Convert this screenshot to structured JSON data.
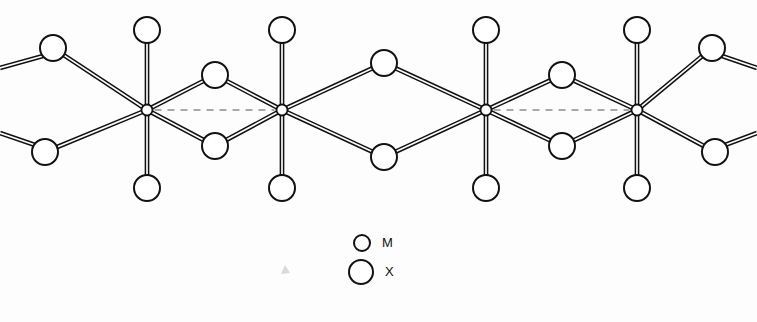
{
  "figure": {
    "kind": "crystal-structure-schematic",
    "background_color": "#fdfdfd",
    "line_color": "#111111",
    "dashed_color": "#8d8d8d",
    "atom_fill": "#ffffff"
  },
  "geometry": {
    "metal_radius": 5.5,
    "ligand_radius": 13,
    "bond_offset": 1.6,
    "metal_y": 110,
    "axial_top_y": 30,
    "axial_bottom_y": 188,
    "bridge_top_y": 75,
    "bridge_bottom_y": 146,
    "equatorial_top_y": 48,
    "equatorial_bottom_y": 152
  },
  "metals": [
    {
      "id": "M1",
      "label": "M",
      "x": 147,
      "y": 110
    },
    {
      "id": "M2",
      "label": "M",
      "x": 282,
      "y": 110
    },
    {
      "id": "M3",
      "label": "M",
      "x": 486,
      "y": 110
    },
    {
      "id": "M4",
      "label": "M",
      "x": 637,
      "y": 110
    }
  ],
  "metal_contacts": [
    {
      "from": "M1",
      "to": "M2",
      "x1": 147,
      "x2": 282,
      "y": 110,
      "style": "dashed",
      "kind": "short"
    },
    {
      "from": "M2",
      "to": "M3",
      "x1": 282,
      "x2": 486,
      "y": 110,
      "style": "none",
      "kind": "long"
    },
    {
      "from": "M3",
      "to": "M4",
      "x1": 486,
      "x2": 637,
      "y": 110,
      "style": "dashed",
      "kind": "short"
    }
  ],
  "ligands": [
    {
      "id": "X-axial-top-1",
      "label": "X",
      "x": 147,
      "y": 30,
      "role": "axial"
    },
    {
      "id": "X-axial-bot-1",
      "label": "X",
      "x": 147,
      "y": 188,
      "role": "axial"
    },
    {
      "id": "X-axial-top-2",
      "label": "X",
      "x": 282,
      "y": 30,
      "role": "axial"
    },
    {
      "id": "X-axial-bot-2",
      "label": "X",
      "x": 282,
      "y": 188,
      "role": "axial"
    },
    {
      "id": "X-axial-top-3",
      "label": "X",
      "x": 486,
      "y": 30,
      "role": "axial"
    },
    {
      "id": "X-axial-bot-3",
      "label": "X",
      "x": 486,
      "y": 188,
      "role": "axial"
    },
    {
      "id": "X-axial-top-4",
      "label": "X",
      "x": 637,
      "y": 30,
      "role": "axial"
    },
    {
      "id": "X-axial-bot-4",
      "label": "X",
      "x": 637,
      "y": 188,
      "role": "axial"
    },
    {
      "id": "X-bridge-top-12",
      "label": "X",
      "x": 215,
      "y": 75,
      "role": "bridging"
    },
    {
      "id": "X-bridge-bot-12",
      "label": "X",
      "x": 215,
      "y": 146,
      "role": "bridging"
    },
    {
      "id": "X-bridge-top-23",
      "label": "X",
      "x": 384,
      "y": 63,
      "role": "bridging"
    },
    {
      "id": "X-bridge-bot-23",
      "label": "X",
      "x": 384,
      "y": 157,
      "role": "bridging"
    },
    {
      "id": "X-bridge-top-34",
      "label": "X",
      "x": 562,
      "y": 75,
      "role": "bridging"
    },
    {
      "id": "X-bridge-bot-34",
      "label": "X",
      "x": 562,
      "y": 146,
      "role": "bridging"
    },
    {
      "id": "X-term-top-left",
      "label": "X",
      "x": 53,
      "y": 48,
      "role": "terminal"
    },
    {
      "id": "X-term-bot-left",
      "label": "X",
      "x": 45,
      "y": 152,
      "role": "terminal"
    },
    {
      "id": "X-term-top-right",
      "label": "X",
      "x": 712,
      "y": 48,
      "role": "terminal"
    },
    {
      "id": "X-term-bot-right",
      "label": "X",
      "x": 715,
      "y": 152,
      "role": "terminal"
    }
  ],
  "bonds": [
    {
      "from": "M1",
      "to": "X-axial-top-1"
    },
    {
      "from": "M1",
      "to": "X-axial-bot-1"
    },
    {
      "from": "M1",
      "to": "X-bridge-top-12"
    },
    {
      "from": "M1",
      "to": "X-bridge-bot-12"
    },
    {
      "from": "M1",
      "to": "X-term-top-left"
    },
    {
      "from": "M1",
      "to": "X-term-bot-left"
    },
    {
      "from": "M2",
      "to": "X-axial-top-2"
    },
    {
      "from": "M2",
      "to": "X-axial-bot-2"
    },
    {
      "from": "M2",
      "to": "X-bridge-top-12"
    },
    {
      "from": "M2",
      "to": "X-bridge-bot-12"
    },
    {
      "from": "M2",
      "to": "X-bridge-top-23"
    },
    {
      "from": "M2",
      "to": "X-bridge-bot-23"
    },
    {
      "from": "M3",
      "to": "X-axial-top-3"
    },
    {
      "from": "M3",
      "to": "X-axial-bot-3"
    },
    {
      "from": "M3",
      "to": "X-bridge-top-23"
    },
    {
      "from": "M3",
      "to": "X-bridge-bot-23"
    },
    {
      "from": "M3",
      "to": "X-bridge-top-34"
    },
    {
      "from": "M3",
      "to": "X-bridge-bot-34"
    },
    {
      "from": "M4",
      "to": "X-axial-top-4"
    },
    {
      "from": "M4",
      "to": "X-axial-bot-4"
    },
    {
      "from": "M4",
      "to": "X-bridge-top-34"
    },
    {
      "from": "M4",
      "to": "X-bridge-bot-34"
    },
    {
      "from": "M4",
      "to": "X-term-top-right"
    },
    {
      "from": "M4",
      "to": "X-term-bot-right"
    }
  ],
  "chain_stubs": [
    {
      "id": "stub-top-left",
      "from": "X-term-top-left",
      "x1": 43,
      "y1": 56,
      "x2": 0,
      "y2": 68
    },
    {
      "id": "stub-bot-left",
      "from": "X-term-bot-left",
      "x1": 35,
      "y1": 145,
      "x2": 0,
      "y2": 133
    },
    {
      "id": "stub-top-right",
      "from": "X-term-top-right",
      "x1": 722,
      "y1": 56,
      "x2": 757,
      "y2": 68
    },
    {
      "id": "stub-bot-right",
      "from": "X-term-bot-right",
      "x1": 725,
      "y1": 145,
      "x2": 757,
      "y2": 133
    }
  ],
  "legend": {
    "items": [
      {
        "symbol": "M",
        "label": "M",
        "circle_x": 362,
        "circle_y": 243,
        "radius": 8,
        "text_x": 382
      },
      {
        "symbol": "X",
        "label": "X",
        "circle_x": 361,
        "circle_y": 272,
        "radius": 12,
        "text_x": 385
      }
    ]
  },
  "artifacts": [
    {
      "id": "scan-speck",
      "x": 285,
      "y": 270,
      "color": "#bdbdbd"
    }
  ]
}
